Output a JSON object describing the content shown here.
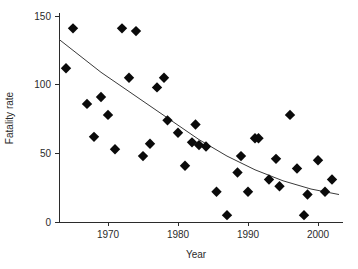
{
  "chart_data": {
    "type": "scatter",
    "title": "",
    "xlabel": "Year",
    "ylabel": "Fatality rate",
    "xlim": [
      1963,
      2003.5
    ],
    "ylim": [
      0,
      152
    ],
    "grid": false,
    "legend": null,
    "xticks": [
      1970,
      1980,
      1990,
      2000
    ],
    "xtick_labels": [
      "1970",
      "1980",
      "1990",
      "2000"
    ],
    "yticks": [
      0,
      50,
      100,
      150
    ],
    "ytick_labels": [
      "0",
      "50",
      "100",
      "150"
    ],
    "marker": "diamond",
    "marker_color": "#0a0a0a",
    "points": [
      {
        "x": 1964,
        "y": 112
      },
      {
        "x": 1965,
        "y": 141
      },
      {
        "x": 1967,
        "y": 86
      },
      {
        "x": 1968,
        "y": 62
      },
      {
        "x": 1969,
        "y": 91
      },
      {
        "x": 1970,
        "y": 78
      },
      {
        "x": 1971,
        "y": 53
      },
      {
        "x": 1972,
        "y": 141
      },
      {
        "x": 1973,
        "y": 105
      },
      {
        "x": 1974,
        "y": 139
      },
      {
        "x": 1975,
        "y": 48
      },
      {
        "x": 1976,
        "y": 57
      },
      {
        "x": 1977,
        "y": 98
      },
      {
        "x": 1978,
        "y": 105
      },
      {
        "x": 1978.5,
        "y": 74
      },
      {
        "x": 1980,
        "y": 65
      },
      {
        "x": 1981,
        "y": 41
      },
      {
        "x": 1982,
        "y": 58
      },
      {
        "x": 1982.5,
        "y": 71
      },
      {
        "x": 1983,
        "y": 56
      },
      {
        "x": 1984,
        "y": 55
      },
      {
        "x": 1985.5,
        "y": 22
      },
      {
        "x": 1987,
        "y": 5
      },
      {
        "x": 1988.5,
        "y": 36
      },
      {
        "x": 1989,
        "y": 48
      },
      {
        "x": 1990,
        "y": 22
      },
      {
        "x": 1991,
        "y": 61
      },
      {
        "x": 1991.5,
        "y": 61
      },
      {
        "x": 1993,
        "y": 31
      },
      {
        "x": 1994,
        "y": 46
      },
      {
        "x": 1994.5,
        "y": 26
      },
      {
        "x": 1996,
        "y": 78
      },
      {
        "x": 1997,
        "y": 39
      },
      {
        "x": 1998,
        "y": 5
      },
      {
        "x": 1998.5,
        "y": 20
      },
      {
        "x": 2000,
        "y": 45
      },
      {
        "x": 2001,
        "y": 22
      },
      {
        "x": 2002,
        "y": 31
      }
    ],
    "trend": {
      "type": "exponential-fit",
      "points": [
        {
          "x": 1963.0,
          "y": 133
        },
        {
          "x": 1965.0,
          "y": 125
        },
        {
          "x": 1967.0,
          "y": 117
        },
        {
          "x": 1969.0,
          "y": 109
        },
        {
          "x": 1971.0,
          "y": 102
        },
        {
          "x": 1973.0,
          "y": 95
        },
        {
          "x": 1975.0,
          "y": 88
        },
        {
          "x": 1977.0,
          "y": 81
        },
        {
          "x": 1979.0,
          "y": 74
        },
        {
          "x": 1981.0,
          "y": 67
        },
        {
          "x": 1983.0,
          "y": 60
        },
        {
          "x": 1985.0,
          "y": 54
        },
        {
          "x": 1987.0,
          "y": 48
        },
        {
          "x": 1989.0,
          "y": 43
        },
        {
          "x": 1991.0,
          "y": 38
        },
        {
          "x": 1993.0,
          "y": 34
        },
        {
          "x": 1995.0,
          "y": 30
        },
        {
          "x": 1997.0,
          "y": 27
        },
        {
          "x": 1999.0,
          "y": 24
        },
        {
          "x": 2001.0,
          "y": 22
        },
        {
          "x": 2003.0,
          "y": 20
        }
      ]
    }
  }
}
